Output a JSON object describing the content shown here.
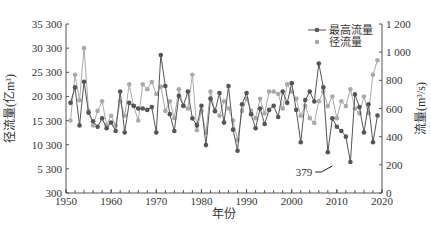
{
  "chart_data": {
    "type": "line",
    "title": "",
    "xlabel": "年份",
    "ylabel_left": "径流量(亿m³)",
    "ylabel_right": "流量(m³/s)",
    "x_ticks": [
      "1950",
      "1960",
      "1970",
      "1980",
      "1990",
      "2000",
      "2010",
      "2020"
    ],
    "y_left_ticks": [
      "300",
      "5 300",
      "10 300",
      "15 300",
      "20 300",
      "25 300",
      "30 300",
      "35 300"
    ],
    "y_right_ticks": [
      "0",
      "200",
      "400",
      "600",
      "800",
      "1 000",
      "1 200"
    ],
    "ylim_left": [
      300,
      35300
    ],
    "ylim_right": [
      0,
      1200
    ],
    "xlim": [
      1950,
      2020
    ],
    "grid": false,
    "legend_position": "upper right",
    "annotation": {
      "text": "379",
      "year": 2005
    },
    "x": [
      1951,
      1952,
      1953,
      1954,
      1955,
      1956,
      1957,
      1958,
      1959,
      1960,
      1961,
      1962,
      1963,
      1964,
      1965,
      1966,
      1967,
      1968,
      1969,
      1970,
      1971,
      1972,
      1973,
      1974,
      1975,
      1976,
      1977,
      1978,
      1979,
      1980,
      1981,
      1982,
      1983,
      1984,
      1985,
      1986,
      1987,
      1988,
      1989,
      1990,
      1991,
      1992,
      1993,
      1994,
      1995,
      1996,
      1997,
      1998,
      1999,
      2000,
      2001,
      2002,
      2003,
      2004,
      2005,
      2006,
      2007,
      2008,
      2009,
      2010,
      2011,
      2012,
      2013,
      2014,
      2015,
      2016,
      2017,
      2018,
      2019
    ],
    "series": [
      {
        "name": "最高流量",
        "axis": "right",
        "color": "#555555",
        "values": [
          640,
          750,
          480,
          790,
          570,
          510,
          470,
          530,
          460,
          500,
          440,
          720,
          430,
          640,
          620,
          600,
          600,
          590,
          610,
          430,
          980,
          760,
          560,
          440,
          690,
          620,
          720,
          530,
          480,
          620,
          340,
          670,
          580,
          710,
          500,
          760,
          450,
          300,
          630,
          710,
          560,
          460,
          600,
          490,
          590,
          620,
          540,
          720,
          640,
          780,
          590,
          360,
          660,
          720,
          650,
          920,
          750,
          290,
          530,
          470,
          440,
          400,
          220,
          700,
          610,
          430,
          630,
          360,
          550
        ]
      },
      {
        "name": "径流量",
        "axis": "left",
        "color": "#aaaaaa",
        "values": [
          15300,
          24800,
          19500,
          30300,
          17300,
          14300,
          17300,
          19300,
          14300,
          16300,
          14300,
          19300,
          16300,
          22800,
          18300,
          15300,
          22800,
          21800,
          23300,
          20800,
          22300,
          17300,
          19300,
          15800,
          21800,
          18300,
          17800,
          24800,
          13300,
          17300,
          12800,
          21300,
          17300,
          16300,
          19300,
          17800,
          15300,
          11300,
          17300,
          19800,
          17300,
          15800,
          19800,
          16800,
          21300,
          21300,
          20800,
          17800,
          22800,
          21300,
          19800,
          16300,
          18300,
          15800,
          14800,
          19300,
          21300,
          18300,
          20300,
          15800,
          19300,
          18300,
          21800,
          17800,
          16800,
          20300,
          16800,
          24800,
          27800
        ]
      }
    ]
  },
  "legend": {
    "items": [
      "最高流量",
      "径流量"
    ]
  },
  "axes": {
    "xlabel": "年份",
    "ylabel_left": "径流量(亿m³)",
    "ylabel_right": "流量(m³/s)"
  }
}
